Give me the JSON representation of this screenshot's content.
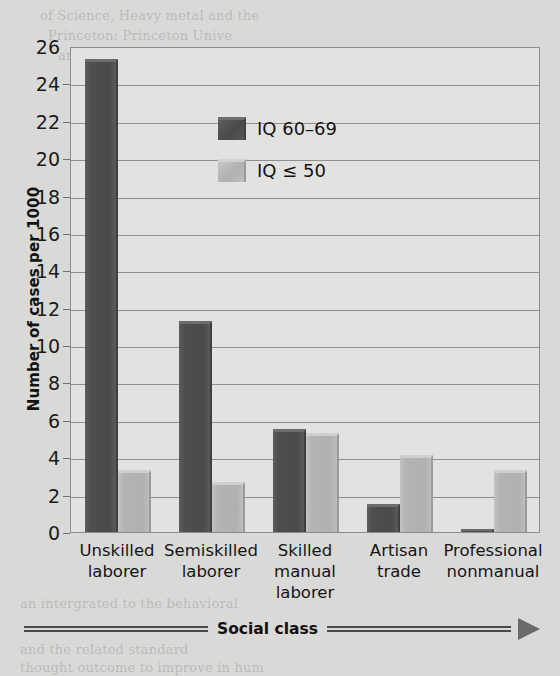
{
  "chart_data": {
    "type": "bar",
    "title": "",
    "xlabel": "Social class",
    "ylabel": "Number of cases per 1000",
    "ylim": [
      0,
      26
    ],
    "ytick_step": 2,
    "yticks": [
      0,
      2,
      4,
      6,
      8,
      10,
      12,
      14,
      16,
      18,
      20,
      22,
      24,
      26
    ],
    "grid": true,
    "legend_position": "upper center",
    "categories": [
      "Unskilled laborer",
      "Semiskilled laborer",
      "Skilled manual laborer",
      "Artisan trade",
      "Professional nonmanual"
    ],
    "category_lines": [
      [
        "Unskilled",
        "laborer"
      ],
      [
        "Semiskilled",
        "laborer"
      ],
      [
        "Skilled",
        "manual",
        "laborer"
      ],
      [
        "Artisan",
        "trade"
      ],
      [
        "Professional",
        "nonmanual"
      ]
    ],
    "series": [
      {
        "name": "IQ 60–69",
        "color": "#4a4a4a",
        "values": [
          25.3,
          11.3,
          5.5,
          1.5,
          0.15
        ]
      },
      {
        "name": "IQ ≤ 50",
        "color": "#b2b2b0",
        "values": [
          3.3,
          2.7,
          5.3,
          4.1,
          3.3
        ]
      }
    ]
  },
  "legend": {
    "items": [
      {
        "label": "IQ 60–69",
        "swatch": "dark"
      },
      {
        "label": "IQ ≤ 50",
        "swatch": "light"
      }
    ]
  },
  "axis": {
    "x_title": "Social class",
    "y_title": "Number of cases per 1000"
  },
  "page_bleed": {
    "lines": [
      "of Science, Heavy metal and the",
      "Princeton: Princeton Unive",
      "and the mind of man.",
      "Family",
      "and bio",
      "studies some are considered ban",
      "Ives & Weinart. 8008.",
      "Concepts with 2005.",
      "an intergrated to the behavioral",
      "and the related standard",
      "thought outcome to improve in hum"
    ]
  }
}
